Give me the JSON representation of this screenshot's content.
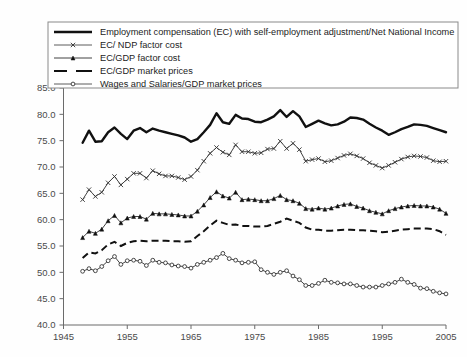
{
  "chart_data": {
    "type": "line",
    "title": "",
    "xlabel": "",
    "ylabel": "",
    "xlim": [
      1945,
      2005
    ],
    "ylim": [
      40.0,
      85.0
    ],
    "xticks": [
      "1945",
      "1955",
      "1965",
      "1975",
      "1985",
      "1995",
      "2005"
    ],
    "xtick_values": [
      1945,
      1955,
      1965,
      1975,
      1985,
      1995,
      2005
    ],
    "yticks": [
      "40.0",
      "45.0",
      "50.0",
      "55.0",
      "60.0",
      "65.0",
      "70.0",
      "75.0",
      "80.0",
      "85.0"
    ],
    "ytick_values": [
      40.0,
      45.0,
      50.0,
      55.0,
      60.0,
      65.0,
      70.0,
      75.0,
      80.0,
      85.0
    ],
    "grid": false,
    "legend_position": "top",
    "x": [
      1948,
      1949,
      1950,
      1951,
      1952,
      1953,
      1954,
      1955,
      1956,
      1957,
      1958,
      1959,
      1960,
      1961,
      1962,
      1963,
      1964,
      1965,
      1966,
      1967,
      1968,
      1969,
      1970,
      1971,
      1972,
      1973,
      1974,
      1975,
      1976,
      1977,
      1978,
      1979,
      1980,
      1981,
      1982,
      1983,
      1984,
      1985,
      1986,
      1987,
      1988,
      1989,
      1990,
      1991,
      1992,
      1993,
      1994,
      1995,
      1996,
      1997,
      1998,
      1999,
      2000,
      2001,
      2002,
      2003,
      2004,
      2005
    ],
    "series": [
      {
        "name": "Employment compensation (EC) with self-employment adjustment/Net National Income",
        "style": "thick-solid",
        "marker": "none",
        "color": "#111111",
        "values": [
          74.6,
          76.9,
          74.8,
          74.9,
          76.6,
          77.5,
          76.3,
          75.3,
          76.9,
          77.4,
          76.6,
          77.3,
          76.9,
          76.6,
          76.3,
          76.0,
          75.6,
          74.8,
          75.3,
          76.6,
          78.0,
          80.2,
          78.5,
          78.2,
          79.9,
          79.2,
          79.1,
          78.6,
          78.5,
          79.0,
          79.6,
          80.8,
          79.5,
          80.6,
          79.6,
          77.6,
          78.2,
          78.8,
          78.3,
          77.9,
          78.1,
          78.6,
          79.4,
          79.3,
          79.0,
          78.2,
          77.5,
          76.9,
          76.1,
          76.6,
          77.2,
          77.6,
          78.1,
          78.0,
          77.8,
          77.4,
          77.0,
          76.6
        ]
      },
      {
        "name": "EC/ NDP factor cost",
        "style": "thin-solid",
        "marker": "x",
        "color": "#333333",
        "values": [
          63.8,
          65.7,
          64.4,
          65.2,
          67.0,
          68.2,
          66.6,
          67.7,
          68.8,
          68.8,
          67.9,
          69.3,
          68.7,
          68.3,
          68.3,
          68.0,
          67.6,
          68.2,
          69.4,
          71.1,
          72.6,
          73.7,
          72.8,
          72.3,
          74.2,
          72.9,
          72.9,
          72.6,
          72.7,
          73.4,
          73.5,
          74.9,
          73.5,
          74.5,
          73.3,
          71.1,
          71.4,
          71.6,
          71.0,
          71.2,
          71.7,
          72.2,
          72.5,
          72.1,
          71.6,
          70.8,
          70.3,
          69.8,
          70.3,
          70.9,
          71.5,
          71.9,
          72.1,
          72.0,
          71.8,
          71.2,
          71.0,
          71.1
        ]
      },
      {
        "name": "EC/GDP factor cost",
        "style": "thin-solid",
        "marker": "triangle",
        "color": "#111111",
        "values": [
          56.6,
          57.8,
          57.4,
          58.2,
          59.8,
          60.8,
          59.4,
          60.3,
          60.6,
          60.6,
          60.1,
          61.2,
          61.1,
          61.1,
          61.0,
          60.9,
          60.7,
          60.7,
          61.6,
          62.8,
          64.2,
          65.3,
          64.5,
          64.1,
          65.2,
          63.8,
          63.9,
          63.8,
          63.6,
          63.6,
          64.0,
          64.6,
          63.8,
          63.6,
          63.1,
          62.1,
          62.0,
          62.2,
          62.0,
          62.2,
          62.6,
          62.9,
          63.0,
          62.5,
          62.2,
          61.7,
          61.4,
          61.1,
          61.7,
          62.1,
          62.4,
          62.6,
          62.7,
          62.6,
          62.6,
          62.4,
          62.0,
          61.2
        ]
      },
      {
        "name": "EC/GDP market prices",
        "style": "dashed",
        "marker": "none",
        "color": "#111111",
        "values": [
          52.7,
          53.8,
          53.6,
          54.2,
          55.3,
          55.8,
          55.0,
          55.6,
          55.9,
          56.0,
          55.9,
          56.0,
          56.0,
          56.0,
          55.9,
          55.9,
          55.8,
          55.9,
          56.9,
          57.8,
          58.9,
          59.8,
          59.4,
          59.0,
          59.1,
          58.8,
          58.8,
          58.7,
          58.7,
          58.8,
          59.2,
          59.6,
          60.2,
          59.8,
          59.4,
          58.5,
          58.1,
          58.1,
          57.9,
          57.9,
          58.0,
          58.1,
          58.1,
          58.0,
          58.0,
          57.9,
          57.8,
          57.6,
          57.7,
          57.9,
          58.1,
          58.2,
          58.3,
          58.3,
          58.3,
          58.2,
          57.8,
          57.1
        ]
      },
      {
        "name": "Wages and Salaries/GDP market prices",
        "style": "thin-solid",
        "marker": "circle",
        "color": "#333333",
        "values": [
          50.2,
          50.7,
          50.3,
          51.1,
          52.2,
          53.0,
          51.5,
          52.2,
          52.3,
          52.1,
          51.3,
          52.3,
          51.9,
          51.8,
          51.4,
          51.2,
          51.1,
          50.8,
          51.5,
          51.9,
          52.3,
          52.8,
          53.6,
          52.6,
          52.3,
          51.8,
          51.9,
          52.0,
          50.5,
          50.0,
          49.6,
          50.0,
          50.3,
          49.3,
          48.6,
          47.5,
          47.5,
          47.9,
          48.5,
          48.1,
          48.0,
          47.8,
          47.8,
          47.5,
          47.2,
          47.2,
          47.2,
          47.5,
          47.8,
          48.1,
          48.7,
          48.1,
          47.7,
          47.0,
          46.9,
          46.4,
          46.1,
          45.9
        ]
      }
    ]
  },
  "legend": {
    "items": [
      {
        "label": "Employment compensation (EC) with self-employment adjustment/Net National Income",
        "swatch": "thick-line-swatch"
      },
      {
        "label": "EC/ NDP factor cost",
        "swatch": "line-x-marker-swatch"
      },
      {
        "label": "EC/GDP factor cost",
        "swatch": "line-triangle-marker-swatch"
      },
      {
        "label": "EC/GDP market prices",
        "swatch": "dashed-line-swatch"
      },
      {
        "label": "Wages and Salaries/GDP market prices",
        "swatch": "line-circle-marker-swatch"
      }
    ]
  },
  "colors": {
    "background": "#fefefe",
    "axis": "#6b6b6b",
    "tick_text": "#4a4a4a",
    "series_ink": "#111111",
    "legend_border": "#8a8a8a"
  }
}
